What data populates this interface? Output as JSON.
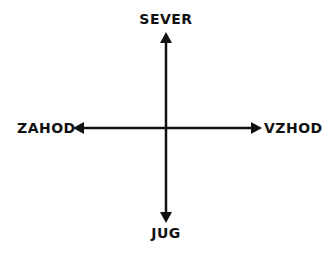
{
  "diagram": {
    "title": "",
    "type": "compass-directions",
    "labels": {
      "north": "SEVER",
      "south": "JUG",
      "west": "ZAHOD",
      "east": "VZHOD"
    },
    "colors": {
      "line": "#111111",
      "background": "#ffffff"
    }
  }
}
